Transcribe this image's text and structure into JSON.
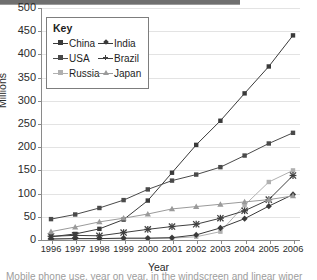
{
  "axis": {
    "ylabel": "Millions",
    "xlabel": "Year",
    "yticks": [
      "0",
      "50",
      "100",
      "150",
      "200",
      "250",
      "300",
      "350",
      "400",
      "450",
      "500"
    ],
    "xticks": [
      "1996",
      "1997",
      "1998",
      "1999",
      "2000",
      "2001",
      "2002",
      "2003",
      "2004",
      "2005",
      "2006"
    ]
  },
  "legend": {
    "title": "Key",
    "items": [
      {
        "label": "China",
        "color": "#3a3a3a",
        "marker": "square"
      },
      {
        "label": "India",
        "color": "#3a3a3a",
        "marker": "diamond"
      },
      {
        "label": "USA",
        "color": "#4a4a4a",
        "marker": "square"
      },
      {
        "label": "Brazil",
        "color": "#3f3f3f",
        "marker": "cross"
      },
      {
        "label": "Russia",
        "color": "#b0b0b0",
        "marker": "square"
      },
      {
        "label": "Japan",
        "color": "#9a9a9a",
        "marker": "triangle"
      }
    ]
  },
  "caption": "Mobile phone use, year on year, in the windscreen and linear wiper",
  "chart_data": {
    "type": "line",
    "title": "",
    "xlabel": "Year",
    "ylabel": "Millions",
    "ylim": [
      0,
      500
    ],
    "grid": true,
    "legend_position": "top-left",
    "categories": [
      "1996",
      "1997",
      "1998",
      "1999",
      "2000",
      "2001",
      "2002",
      "2003",
      "2004",
      "2005",
      "2006"
    ],
    "series": [
      {
        "name": "China",
        "color": "#3a3a3a",
        "marker": "square",
        "values": [
          7,
          13,
          24,
          44,
          85,
          145,
          205,
          257,
          316,
          374,
          441
        ]
      },
      {
        "name": "USA",
        "color": "#4a4a4a",
        "marker": "square",
        "values": [
          45,
          55,
          69,
          86,
          109,
          128,
          141,
          157,
          182,
          208,
          231
        ]
      },
      {
        "name": "Russia",
        "color": "#b0b0b0",
        "marker": "square",
        "values": [
          3,
          3,
          3,
          3,
          3,
          4,
          7,
          18,
          75,
          125,
          150
        ]
      },
      {
        "name": "Brazil",
        "color": "#3f3f3f",
        "marker": "cross",
        "values": [
          8,
          10,
          9,
          16,
          23,
          29,
          34,
          47,
          63,
          87,
          139
        ]
      },
      {
        "name": "India",
        "color": "#3a3a3a",
        "marker": "diamond",
        "values": [
          2,
          3,
          3,
          4,
          4,
          5,
          11,
          26,
          46,
          73,
          98
        ]
      },
      {
        "name": "Japan",
        "color": "#9a9a9a",
        "marker": "triangle",
        "values": [
          18,
          28,
          39,
          47,
          56,
          67,
          72,
          77,
          82,
          87,
          95
        ]
      }
    ]
  }
}
